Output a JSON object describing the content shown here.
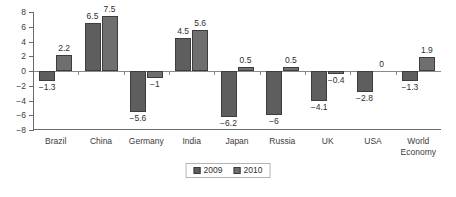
{
  "chart_data": {
    "type": "bar",
    "title": "",
    "subtitle": "",
    "xlabel": "",
    "ylabel": "",
    "ylim": [
      -8,
      8
    ],
    "yticks": [
      8,
      6,
      4,
      2,
      0,
      -2,
      -4,
      -6,
      -8
    ],
    "ytick_labels": [
      "8",
      "6",
      "4",
      "2",
      "0",
      "−2",
      "−4",
      "−6",
      "−8"
    ],
    "grid": false,
    "legend_position": "bottom-center",
    "categories": [
      "Brazil",
      "China",
      "Germany",
      "India",
      "Japan",
      "Russia",
      "UK",
      "USA",
      "World\nEconomy"
    ],
    "series": [
      {
        "name": "2009",
        "color": "#5e5e5e",
        "values": [
          -1.3,
          6.5,
          -5.6,
          4.5,
          -6.2,
          -6,
          -4.1,
          -2.8,
          -1.3
        ],
        "data_labels": [
          "−1.3",
          "6.5",
          "−5.6",
          "4.5",
          "−6.2",
          "−6",
          "−4.1",
          "−2.8",
          "−1.3"
        ]
      },
      {
        "name": "2010",
        "color": "#6f6f6f",
        "values": [
          2.2,
          7.5,
          -1,
          5.6,
          0.5,
          0.5,
          -0.4,
          0,
          1.9
        ],
        "data_labels": [
          "2.2",
          "7.5",
          "−1",
          "5.6",
          "0.5",
          "0.5",
          "−0.4",
          "0",
          "1.9"
        ]
      }
    ]
  },
  "legend": {
    "items": [
      {
        "label": "2009",
        "color": "#5e5e5e"
      },
      {
        "label": "2010",
        "color": "#6f6f6f"
      }
    ]
  },
  "colors": {
    "series_2009": "#5e5e5e",
    "series_2010": "#6f6f6f",
    "axis": "#6b6b6b",
    "text": "#3b3b3b",
    "background": "#ffffff"
  }
}
